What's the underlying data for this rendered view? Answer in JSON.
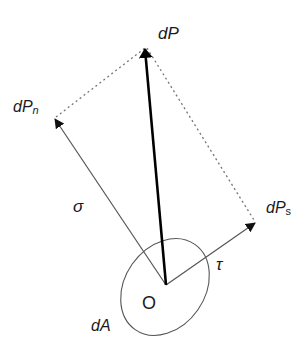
{
  "diagram": {
    "labels": {
      "resultant": "dP",
      "normal_component_main": "dP",
      "normal_component_sub": "n",
      "shear_component_main": "dP",
      "shear_component_sub": "s",
      "normal_stress": "σ",
      "shear_stress": "τ",
      "origin": "O",
      "area": "dA"
    },
    "colors": {
      "resultant_arrow": "#000000",
      "component_arrows": "#555555",
      "dotted_lines": "#777777",
      "ellipse": "#555555",
      "text": "#1a1a1a"
    },
    "geometry": {
      "origin": [
        166,
        285
      ],
      "resultant_tip": [
        145,
        47
      ],
      "normal_tip": [
        54,
        118
      ],
      "shear_tip": [
        256,
        222
      ]
    }
  }
}
